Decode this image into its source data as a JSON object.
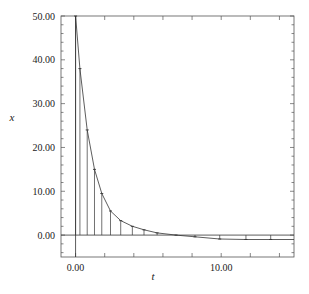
{
  "chart_data": {
    "type": "line",
    "title": "",
    "xlabel": "t",
    "ylabel": "x",
    "xlim": [
      -1,
      15
    ],
    "ylim": [
      -5,
      50
    ],
    "grid": false,
    "legend": null,
    "x_ticks": [
      0,
      10
    ],
    "x_tick_labels": [
      "0.00",
      "10.00"
    ],
    "x_minor_tick_step": 2,
    "y_ticks": [
      0,
      10,
      20,
      30,
      40,
      50
    ],
    "y_tick_labels": [
      "0.00",
      "10.00",
      "20.00",
      "30.00",
      "40.00",
      "50.00"
    ],
    "y_minor_tick_step": 2,
    "reference_lines": {
      "horizontal_y": 0,
      "vertical_x": 0
    },
    "series": [
      {
        "name": "x(t) curve with solver-step stems",
        "style": "line+stems",
        "x": [
          0,
          0.3,
          0.8,
          1.3,
          1.8,
          2.4,
          3.1,
          3.9,
          4.7,
          5.6,
          6.9,
          8.2,
          9.9,
          11.7,
          13.4
        ],
        "y": [
          50,
          38,
          24,
          15,
          9.5,
          5.5,
          3.3,
          2.0,
          1.2,
          0.5,
          0.0,
          -0.4,
          -0.9,
          -1.0,
          -1.0
        ]
      }
    ]
  },
  "axes": {
    "x_label": "t",
    "y_label": "x"
  }
}
